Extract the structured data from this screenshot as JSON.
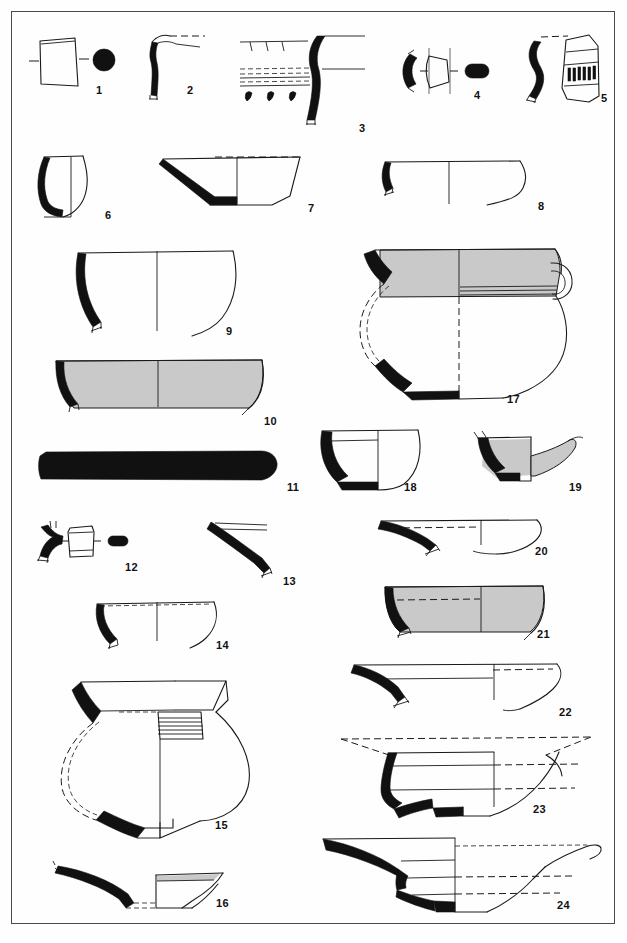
{
  "plate": {
    "title": "Archaeological pottery profile plate",
    "description": "Line-drawing plate of 24 ceramic vessel profiles and sherds, drawn in section with black-filled fabric, grey-shaded slip and dashed reconstruction lines.",
    "border_color": "#4a4a4a",
    "background_color": "#ffffff",
    "ink_color": "#1a1a1a",
    "fill_black": "#111111",
    "fill_grey": "#c9c9c9",
    "figure_count": 24
  },
  "figures": [
    {
      "number": "1",
      "label_x": 101,
      "label_y": 90,
      "kind": "sherd-with-section",
      "description": "Small rectangular body sherd with section bars and a solid black circular section dot"
    },
    {
      "number": "2",
      "label_x": 192,
      "label_y": 90,
      "kind": "rim-profile",
      "description": "Everted rim profile, black section, dashed reconstruction of rim diameter"
    },
    {
      "number": "3",
      "label_x": 363,
      "label_y": 128,
      "kind": "decorated-sherd-and-profile",
      "description": "Incised and impressed decoration panel above a tall carinated black rim/neck profile"
    },
    {
      "number": "4",
      "label_x": 478,
      "label_y": 95,
      "kind": "handle-sections",
      "description": "Handle in profile with cross-section outline and solid black oval section"
    },
    {
      "number": "5",
      "label_x": 605,
      "label_y": 98,
      "kind": "rim-and-decorated-sherd",
      "description": "Black S-profile rim beside a sherd with a band of vertical impressed strokes"
    },
    {
      "number": "6",
      "label_x": 110,
      "label_y": 215,
      "kind": "small-cup",
      "description": "Small rounded cup profile, black wall section, full height preserved"
    },
    {
      "number": "7",
      "label_x": 313,
      "label_y": 208,
      "kind": "open-bowl",
      "description": "Open flaring bowl with flat base, black wall and base section, dashed rim line"
    },
    {
      "number": "8",
      "label_x": 543,
      "label_y": 206,
      "kind": "shallow-bowl",
      "description": "Shallow wide bowl, thin wall with short black rim section"
    },
    {
      "number": "9",
      "label_x": 231,
      "label_y": 331,
      "kind": "hemispherical-bowl",
      "description": "Deep hemispherical bowl, black curved wall section, centre axis line"
    },
    {
      "number": "10",
      "label_x": 271,
      "label_y": 421,
      "kind": "grey-bowl",
      "description": "Wide shallow bowl with grey-shaded slipped interior and black rim section"
    },
    {
      "number": "11",
      "label_x": 294,
      "label_y": 487,
      "kind": "solid-bar",
      "description": "Solid black elongated object, possibly a handle or lid in section"
    },
    {
      "number": "12",
      "label_x": 132,
      "label_y": 567,
      "kind": "handle-sections",
      "description": "Small black handle profile with outlined cross-section and solid black section bar"
    },
    {
      "number": "13",
      "label_x": 290,
      "label_y": 581,
      "kind": "flat-rim",
      "description": "Oblique flat rim/ledge fragment with black section"
    },
    {
      "number": "14",
      "label_x": 223,
      "label_y": 645,
      "kind": "shallow-bowl",
      "description": "Shallow bowl with thin wall, black rim section and dashed rim band"
    },
    {
      "number": "15",
      "label_x": 222,
      "label_y": 825,
      "kind": "large-jar",
      "description": "Large carinated jar with everted rim, ribbed neck detail, black section and dashed reconstruction"
    },
    {
      "number": "16",
      "label_x": 223,
      "label_y": 903,
      "kind": "platter",
      "description": "Flat platter/lid fragment, black sloping section with upright grey-topped wall"
    },
    {
      "number": "17",
      "label_x": 514,
      "label_y": 399,
      "kind": "handled-jar",
      "description": "Globular jar with grey-shaded band, strap handle, black section and dashed reconstruction"
    },
    {
      "number": "18",
      "label_x": 411,
      "label_y": 487,
      "kind": "deep-cup",
      "description": "Deep cup with black wall and base section, interior line below rim"
    },
    {
      "number": "19",
      "label_x": 576,
      "label_y": 487,
      "kind": "base-and-foot",
      "description": "Base fragment with grey-shaded body and projecting grey foot/spout"
    },
    {
      "number": "20",
      "label_x": 542,
      "label_y": 551,
      "kind": "flat-plate",
      "description": "Very shallow plate with black ledge rim and dashed interior band"
    },
    {
      "number": "21",
      "label_x": 544,
      "label_y": 634,
      "kind": "grey-bowl",
      "description": "Grey-shaded shallow bowl with black rim-to-base section and dashed band"
    },
    {
      "number": "22",
      "label_x": 566,
      "label_y": 712,
      "kind": "shallow-plate",
      "description": "Shallow plate with black ledge rim, horizontal interior lines and dashed band"
    },
    {
      "number": "23",
      "label_x": 540,
      "label_y": 809,
      "kind": "footed-plate",
      "description": "Wide footed plate with stepped black section, dashed flaring rim reconstruction"
    },
    {
      "number": "24",
      "label_x": 564,
      "label_y": 905,
      "kind": "footed-plate",
      "description": "Large footed plate, stepped black wall section, dashed interior bands"
    }
  ],
  "legend": {
    "conventions": [
      {
        "name": "black-fill",
        "meaning": "preserved fabric shown in section"
      },
      {
        "name": "grey-fill",
        "meaning": "slipped or burnished surface"
      },
      {
        "name": "dashed-line",
        "meaning": "reconstructed profile"
      },
      {
        "name": "centre-line",
        "meaning": "vessel axis of rotation"
      }
    ]
  }
}
